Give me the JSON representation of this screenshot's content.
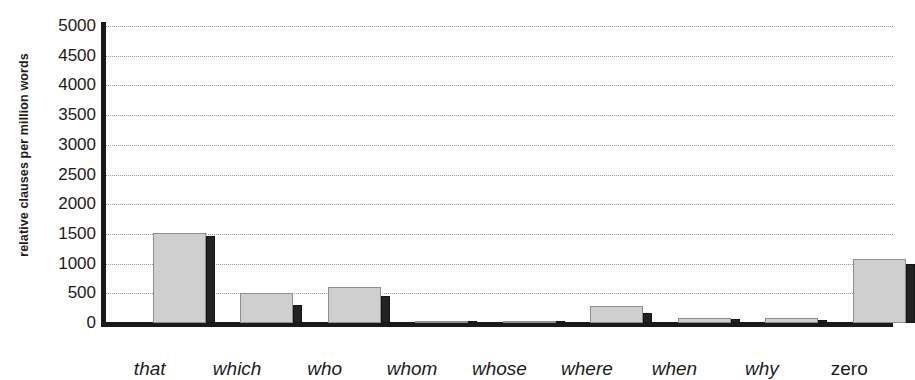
{
  "figure": {
    "top_caption": "",
    "ylabel": "relative clauses per million words"
  },
  "chart_data": {
    "type": "bar",
    "title": "",
    "xlabel": "",
    "ylabel": "relative clauses per million words",
    "ylim": [
      0,
      5000
    ],
    "ytick_labels": [
      "5000",
      "4500",
      "4000",
      "3500",
      "3000",
      "2500",
      "2000",
      "1500",
      "1000",
      "500",
      "0"
    ],
    "ytick_values": [
      5000,
      4500,
      4000,
      3500,
      3000,
      2500,
      2000,
      1500,
      1000,
      500,
      0
    ],
    "grid": true,
    "grid_style": "dotted",
    "legend": false,
    "legend_position": "none",
    "categories": [
      "that",
      "which",
      "who",
      "whom",
      "whose",
      "where",
      "when",
      "why",
      "zero"
    ],
    "category_styles": [
      "italic",
      "italic",
      "italic",
      "italic",
      "italic",
      "italic",
      "italic",
      "italic",
      "upright"
    ],
    "series": [
      {
        "name": "light",
        "color": "#cfcfcf",
        "values": [
          1520,
          500,
          600,
          30,
          15,
          290,
          90,
          80,
          1080
        ]
      },
      {
        "name": "dark",
        "color": "#232323",
        "values": [
          1470,
          300,
          450,
          20,
          10,
          170,
          60,
          50,
          990
        ]
      }
    ]
  },
  "colors": {
    "light_bar": "#cfcfcf",
    "light_bar_edge": "#8f8f8f",
    "dark_bar": "#232323",
    "axis": "#1a1a1a",
    "grid": "#9a9a9a",
    "text": "#1b1b1b",
    "background": "#ffffff"
  }
}
